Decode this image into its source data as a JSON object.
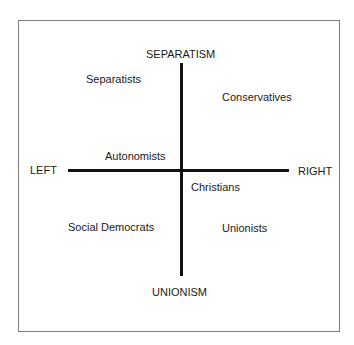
{
  "diagram": {
    "axes": {
      "top": "SEPARATISM",
      "bottom": "UNIONISM",
      "left": "LEFT",
      "right": "RIGHT"
    },
    "parties": [
      {
        "name": "Separatists",
        "quadrant": "top-left"
      },
      {
        "name": "Conservatives",
        "quadrant": "top-right"
      },
      {
        "name": "Autonomists",
        "quadrant": "top-left"
      },
      {
        "name": "Christians",
        "quadrant": "bottom-right"
      },
      {
        "name": "Social Democrats",
        "quadrant": "bottom-left"
      },
      {
        "name": "Unionists",
        "quadrant": "bottom-right"
      }
    ]
  }
}
